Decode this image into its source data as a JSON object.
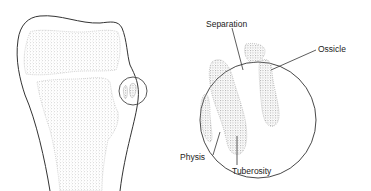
{
  "figure": {
    "labels": {
      "separation": "Separation",
      "ossicle": "Ossicle",
      "physis": "Physis",
      "tuberosity": "Tuberosity"
    },
    "colors": {
      "outline": "#333333",
      "stipple": "#b8b8b8",
      "background": "#ffffff"
    }
  }
}
